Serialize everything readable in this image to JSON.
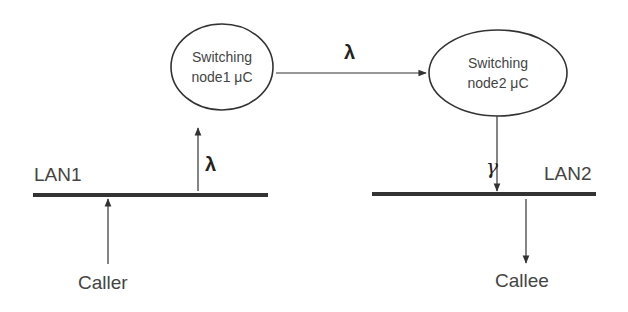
{
  "diagram": {
    "nodes": [
      {
        "id": "node1",
        "line1": "Switching",
        "line2": "node1 μC"
      },
      {
        "id": "node2",
        "line1": "Switching",
        "line2": "node2 μC"
      }
    ],
    "lans": [
      {
        "id": "lan1",
        "label": "LAN1"
      },
      {
        "id": "lan2",
        "label": "LAN2"
      }
    ],
    "endpoints": {
      "caller": "Caller",
      "callee": "Callee"
    },
    "edges": [
      {
        "from": "lan1",
        "to": "node1",
        "label": "λ"
      },
      {
        "from": "node1",
        "to": "node2",
        "label": "λ"
      },
      {
        "from": "node2",
        "to": "lan2",
        "label": "γ"
      },
      {
        "from": "caller",
        "to": "lan1",
        "label": ""
      },
      {
        "from": "lan2",
        "to": "callee",
        "label": ""
      }
    ],
    "colors": {
      "line": "#333333",
      "text": "#444444",
      "background": "#ffffff"
    }
  }
}
